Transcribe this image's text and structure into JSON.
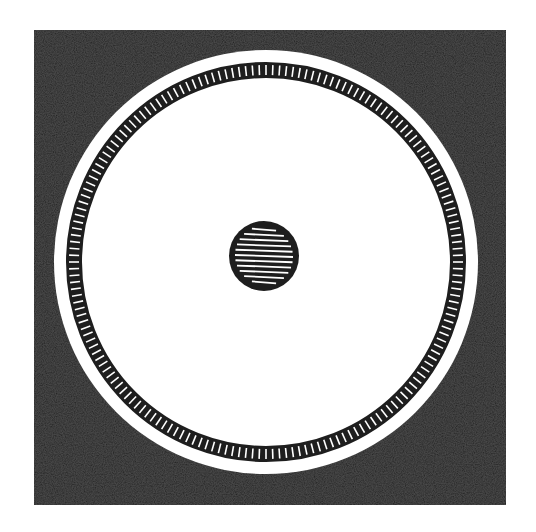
{
  "figure": {
    "description": "Woodcut-style figure: dark square containing a white disc with a hatched ring and a hatched central dot",
    "colors": {
      "ink": "#1e1e1e",
      "paper": "#ffffff",
      "square_fill": "#232323"
    },
    "square": {
      "x": 34,
      "y": 30,
      "width": 472,
      "height": 475
    },
    "disc": {
      "cx": 266,
      "cy": 262,
      "r": 212
    },
    "ring": {
      "cx": 266,
      "cy": 262,
      "r_outer": 200,
      "r_inner": 184,
      "hatch_count": 180
    },
    "center_dot": {
      "cx": 264,
      "cy": 256,
      "r": 35,
      "hatch_lines": 11
    }
  }
}
